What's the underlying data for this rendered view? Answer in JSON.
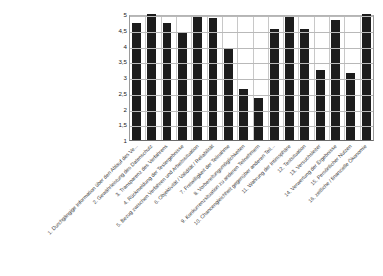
{
  "chart_data": {
    "type": "bar",
    "title": "",
    "subtitle": "",
    "xlabel": "",
    "ylabel": "",
    "ylim": [
      1,
      5
    ],
    "grid": true,
    "legend": "none",
    "y_ticks": [
      "1",
      "1,5",
      "2",
      "2,5",
      "3",
      "3,5",
      "4",
      "4,5",
      "5"
    ],
    "y_tick_values": [
      1,
      1.5,
      2,
      2.5,
      3,
      3.5,
      4,
      4.5,
      5
    ],
    "categories": [
      "1. Durchgängige Information über den Ablauf des Ve...",
      "2. Gewährleistung des Datenschutz",
      "3. Transparenz des Verfahrens",
      "4. Rückmeldung der Testergebnisse",
      "5. Bezug zwischen Verfahren und Arbeitssituation",
      "6. Objektivität / Validität / Reliabilität",
      "7. Freiwilligkeit der Teilnahme",
      "8. Vorbereitungsmöglichkeiten",
      "9. Konkurrenzsituation zu anderen Teilnehmern",
      "10. Chancengleichheit gegenüber anderen Teil...",
      "11. Wahrung der Intimsphäre",
      "12. Testsituation",
      "13. Versuchsleiter",
      "14. Verwertung der Ergebnisse",
      "15. Persönlicher Nutzen",
      "16. zeitliche / finanzielle Ökonomie"
    ],
    "values": [
      4.7,
      5.0,
      4.72,
      4.42,
      4.9,
      4.86,
      3.92,
      2.62,
      2.32,
      4.52,
      4.92,
      4.52,
      3.22,
      4.8,
      3.12,
      5.0
    ],
    "bar_color": "#1c1c1c",
    "background_color": "#ffffff",
    "gridline_color": "#b9b9b9"
  }
}
